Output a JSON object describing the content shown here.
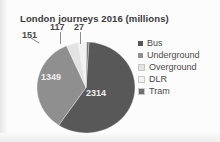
{
  "chart_data": {
    "type": "pie",
    "title": "London journeys 2016 (millions)",
    "xlabel": "",
    "ylabel": "",
    "categories": [
      "Bus",
      "Underground",
      "Overground",
      "DLR",
      "Tram"
    ],
    "values": [
      2314,
      1349,
      151,
      117,
      27
    ],
    "labels": [
      "2314",
      "1349",
      "151",
      "117",
      "27"
    ],
    "colors": [
      "#585858",
      "#8f8f8f",
      "#e3e3e3",
      "#f2f2f2",
      "#6e6e6e"
    ],
    "total": 3958,
    "legend_position": "right",
    "grid": false,
    "legend": [
      {
        "label": "Bus",
        "color": "#585858"
      },
      {
        "label": "Underground",
        "color": "#8f8f8f"
      },
      {
        "label": "Overground",
        "color": "#e3e3e3"
      },
      {
        "label": "DLR",
        "color": "#f2f2f2"
      },
      {
        "label": "Tram",
        "color": "#6e6e6e"
      }
    ]
  }
}
